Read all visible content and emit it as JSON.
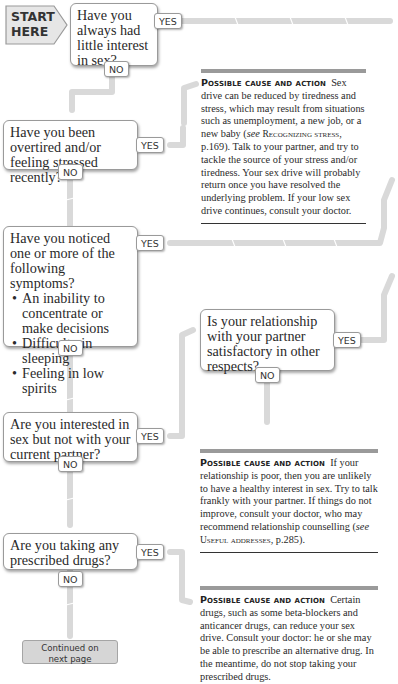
{
  "start": {
    "label_line1": "START",
    "label_line2": "HERE"
  },
  "questions": [
    {
      "id": "q1",
      "text": "Have you always had little interest in sex?",
      "yes": "YES",
      "no": "NO"
    },
    {
      "id": "q2",
      "text": "Have you been overtired and/or feeling stressed recently?",
      "yes": "YES",
      "no": "NO"
    },
    {
      "id": "q3",
      "text": "Have you noticed one or more of the following symptoms?",
      "bullets": [
        "An inability to concentrate or make decisions",
        "Difficulty in sleeping",
        "Feeling in low spirits"
      ],
      "yes": "YES",
      "no": "NO"
    },
    {
      "id": "q3b",
      "text": "Is your relationship with your partner satisfactory in other respects?",
      "yes": "YES",
      "no": "NO"
    },
    {
      "id": "q4",
      "text": "Are you interested in sex but not with your current partner?",
      "yes": "YES",
      "no": "NO"
    },
    {
      "id": "q5",
      "text": "Are you taking any prescribed drugs?",
      "yes": "YES",
      "no": "NO"
    }
  ],
  "answers": [
    {
      "heading": "Possible cause and action",
      "text_pre": "Sex drive can be reduced by tiredness and stress, which may result from situations such as unemployment, a new job, or a new baby (",
      "see": "see",
      "ref": "Recognizing stress",
      "text_post": ", p.169). Talk to your partner, and try to tackle the source of your stress and/or tiredness. Your sex drive will probably return once you have resolved the underlying problem. If your low sex drive continues, consult your doctor."
    },
    {
      "heading": "Possible cause and action",
      "text_pre": "If your relationship is poor, then you are unlikely to have a healthy interest in sex. Try to talk frankly with your partner. If things do not improve, consult your doctor, who may recommend relationship counselling (",
      "see": "see",
      "ref": "Useful addresses",
      "text_post": ", p.285)."
    },
    {
      "heading": "Possible cause and action",
      "text_pre": "Certain drugs, such as some beta-blockers and anticancer drugs, can reduce your sex drive. Consult your doctor: he or she may be able to prescribe an alternative drug. In the meantime, do not stop taking your prescribed drugs.",
      "see": "",
      "ref": "",
      "text_post": ""
    }
  ],
  "continued": {
    "line1": "Continued on",
    "line2": "next page"
  },
  "colors": {
    "connector": "#d9d9d9",
    "box_border": "#9a9a9a",
    "rule": "#9a9a9a",
    "continue_fill": "#d6d6d6"
  }
}
